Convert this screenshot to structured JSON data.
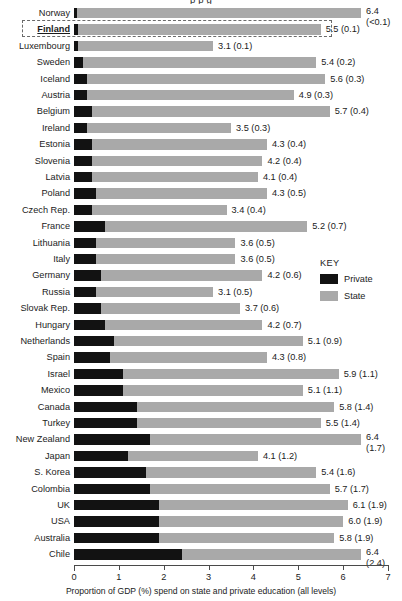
{
  "figure": {
    "clipped_title_fragment": "p   p   g",
    "axis_title": "Proportion of GDP (%) spend on state and private education (all levels)",
    "highlighted_country": "Finland"
  },
  "key": {
    "title": "KEY",
    "items": [
      {
        "label": "Private",
        "color": "#121212",
        "swatch_name": "private-swatch"
      },
      {
        "label": "State",
        "color": "#a9a9a9",
        "swatch_name": "state-swatch"
      }
    ]
  },
  "chart_data": {
    "type": "bar",
    "orientation": "horizontal",
    "stacked": true,
    "title": "",
    "xlabel": "Proportion of GDP (%) spend on state and private education (all levels)",
    "ylabel": "",
    "xlim": [
      0,
      7
    ],
    "xticks": [
      "0",
      "1",
      "2",
      "3",
      "4",
      "5",
      "6",
      "7"
    ],
    "grid": false,
    "legend_position": "right",
    "series": [
      {
        "name": "Private",
        "color": "#121212"
      },
      {
        "name": "State",
        "color": "#a9a9a9"
      }
    ],
    "note": "Rows sorted by ascending private spend. value_label = total (private). Bar total length = total.",
    "categories": [
      "Norway",
      "Finland",
      "Luxembourg",
      "Sweden",
      "Iceland",
      "Austria",
      "Belgium",
      "Ireland",
      "Estonia",
      "Slovenia",
      "Latvia",
      "Poland",
      "Czech Rep.",
      "France",
      "Lithuania",
      "Italy",
      "Germany",
      "Russia",
      "Slovak Rep.",
      "Hungary",
      "Netherlands",
      "Spain",
      "Israel",
      "Mexico",
      "Canada",
      "Turkey",
      "New Zealand",
      "Japan",
      "S. Korea",
      "Colombia",
      "UK",
      "USA",
      "Australia",
      "Chile"
    ],
    "rows": [
      {
        "country": "Norway",
        "total": 6.4,
        "private": 0.05,
        "state": 6.35,
        "value_label": "6.4",
        "paren_label": "(<0.1)",
        "stacked_label": true,
        "highlight": false
      },
      {
        "country": "Finland",
        "total": 5.5,
        "private": 0.1,
        "state": 5.4,
        "value_label": "5.5 (0.1)",
        "paren_label": "",
        "stacked_label": false,
        "highlight": true
      },
      {
        "country": "Luxembourg",
        "total": 3.1,
        "private": 0.1,
        "state": 3.0,
        "value_label": "3.1 (0.1)",
        "paren_label": "",
        "stacked_label": false,
        "highlight": false
      },
      {
        "country": "Sweden",
        "total": 5.4,
        "private": 0.2,
        "state": 5.2,
        "value_label": "5.4 (0.2)",
        "paren_label": "",
        "stacked_label": false,
        "highlight": false
      },
      {
        "country": "Iceland",
        "total": 5.6,
        "private": 0.3,
        "state": 5.3,
        "value_label": "5.6 (0.3)",
        "paren_label": "",
        "stacked_label": false,
        "highlight": false
      },
      {
        "country": "Austria",
        "total": 4.9,
        "private": 0.3,
        "state": 4.6,
        "value_label": "4.9 (0.3)",
        "paren_label": "",
        "stacked_label": false,
        "highlight": false
      },
      {
        "country": "Belgium",
        "total": 5.7,
        "private": 0.4,
        "state": 5.3,
        "value_label": "5.7 (0.4)",
        "paren_label": "",
        "stacked_label": false,
        "highlight": false
      },
      {
        "country": "Ireland",
        "total": 3.5,
        "private": 0.3,
        "state": 3.2,
        "value_label": "3.5 (0.3)",
        "paren_label": "",
        "stacked_label": false,
        "highlight": false
      },
      {
        "country": "Estonia",
        "total": 4.3,
        "private": 0.4,
        "state": 3.9,
        "value_label": "4.3 (0.4)",
        "paren_label": "",
        "stacked_label": false,
        "highlight": false
      },
      {
        "country": "Slovenia",
        "total": 4.2,
        "private": 0.4,
        "state": 3.8,
        "value_label": "4.2 (0.4)",
        "paren_label": "",
        "stacked_label": false,
        "highlight": false
      },
      {
        "country": "Latvia",
        "total": 4.1,
        "private": 0.4,
        "state": 3.7,
        "value_label": "4.1 (0.4)",
        "paren_label": "",
        "stacked_label": false,
        "highlight": false
      },
      {
        "country": "Poland",
        "total": 4.3,
        "private": 0.5,
        "state": 3.8,
        "value_label": "4.3 (0.5)",
        "paren_label": "",
        "stacked_label": false,
        "highlight": false
      },
      {
        "country": "Czech Rep.",
        "total": 3.4,
        "private": 0.4,
        "state": 3.0,
        "value_label": "3.4 (0.4)",
        "paren_label": "",
        "stacked_label": false,
        "highlight": false
      },
      {
        "country": "France",
        "total": 5.2,
        "private": 0.7,
        "state": 4.5,
        "value_label": "5.2 (0.7)",
        "paren_label": "",
        "stacked_label": false,
        "highlight": false
      },
      {
        "country": "Lithuania",
        "total": 3.6,
        "private": 0.5,
        "state": 3.1,
        "value_label": "3.6 (0.5)",
        "paren_label": "",
        "stacked_label": false,
        "highlight": false
      },
      {
        "country": "Italy",
        "total": 3.6,
        "private": 0.5,
        "state": 3.1,
        "value_label": "3.6 (0.5)",
        "paren_label": "",
        "stacked_label": false,
        "highlight": false
      },
      {
        "country": "Germany",
        "total": 4.2,
        "private": 0.6,
        "state": 3.6,
        "value_label": "4.2 (0.6)",
        "paren_label": "",
        "stacked_label": false,
        "highlight": false
      },
      {
        "country": "Russia",
        "total": 3.1,
        "private": 0.5,
        "state": 2.6,
        "value_label": "3.1 (0.5)",
        "paren_label": "",
        "stacked_label": false,
        "highlight": false
      },
      {
        "country": "Slovak Rep.",
        "total": 3.7,
        "private": 0.6,
        "state": 3.1,
        "value_label": "3.7 (0.6)",
        "paren_label": "",
        "stacked_label": false,
        "highlight": false
      },
      {
        "country": "Hungary",
        "total": 4.2,
        "private": 0.7,
        "state": 3.5,
        "value_label": "4.2 (0.7)",
        "paren_label": "",
        "stacked_label": false,
        "highlight": false
      },
      {
        "country": "Netherlands",
        "total": 5.1,
        "private": 0.9,
        "state": 4.2,
        "value_label": "5.1 (0.9)",
        "paren_label": "",
        "stacked_label": false,
        "highlight": false
      },
      {
        "country": "Spain",
        "total": 4.3,
        "private": 0.8,
        "state": 3.5,
        "value_label": "4.3 (0.8)",
        "paren_label": "",
        "stacked_label": false,
        "highlight": false
      },
      {
        "country": "Israel",
        "total": 5.9,
        "private": 1.1,
        "state": 4.8,
        "value_label": "5.9 (1.1)",
        "paren_label": "",
        "stacked_label": false,
        "highlight": false
      },
      {
        "country": "Mexico",
        "total": 5.1,
        "private": 1.1,
        "state": 4.0,
        "value_label": "5.1 (1.1)",
        "paren_label": "",
        "stacked_label": false,
        "highlight": false
      },
      {
        "country": "Canada",
        "total": 5.8,
        "private": 1.4,
        "state": 4.4,
        "value_label": "5.8 (1.4)",
        "paren_label": "",
        "stacked_label": false,
        "highlight": false
      },
      {
        "country": "Turkey",
        "total": 5.5,
        "private": 1.4,
        "state": 4.1,
        "value_label": "5.5 (1.4)",
        "paren_label": "",
        "stacked_label": false,
        "highlight": false
      },
      {
        "country": "New Zealand",
        "total": 6.4,
        "private": 1.7,
        "state": 4.7,
        "value_label": "6.4",
        "paren_label": "(1.7)",
        "stacked_label": true,
        "highlight": false
      },
      {
        "country": "Japan",
        "total": 4.1,
        "private": 1.2,
        "state": 2.9,
        "value_label": "4.1 (1.2)",
        "paren_label": "",
        "stacked_label": false,
        "highlight": false
      },
      {
        "country": "S. Korea",
        "total": 5.4,
        "private": 1.6,
        "state": 3.8,
        "value_label": "5.4 (1.6)",
        "paren_label": "",
        "stacked_label": false,
        "highlight": false
      },
      {
        "country": "Colombia",
        "total": 5.7,
        "private": 1.7,
        "state": 4.0,
        "value_label": "5.7 (1.7)",
        "paren_label": "",
        "stacked_label": false,
        "highlight": false
      },
      {
        "country": "UK",
        "total": 6.1,
        "private": 1.9,
        "state": 4.2,
        "value_label": "6.1 (1.9)",
        "paren_label": "",
        "stacked_label": false,
        "highlight": false
      },
      {
        "country": "USA",
        "total": 6.0,
        "private": 1.9,
        "state": 4.1,
        "value_label": "6.0 (1.9)",
        "paren_label": "",
        "stacked_label": false,
        "highlight": false
      },
      {
        "country": "Australia",
        "total": 5.8,
        "private": 1.9,
        "state": 3.9,
        "value_label": "5.8 (1.9)",
        "paren_label": "",
        "stacked_label": false,
        "highlight": false
      },
      {
        "country": "Chile",
        "total": 6.4,
        "private": 2.4,
        "state": 4.0,
        "value_label": "6.4",
        "paren_label": "(2.4)",
        "stacked_label": true,
        "highlight": false
      }
    ]
  }
}
